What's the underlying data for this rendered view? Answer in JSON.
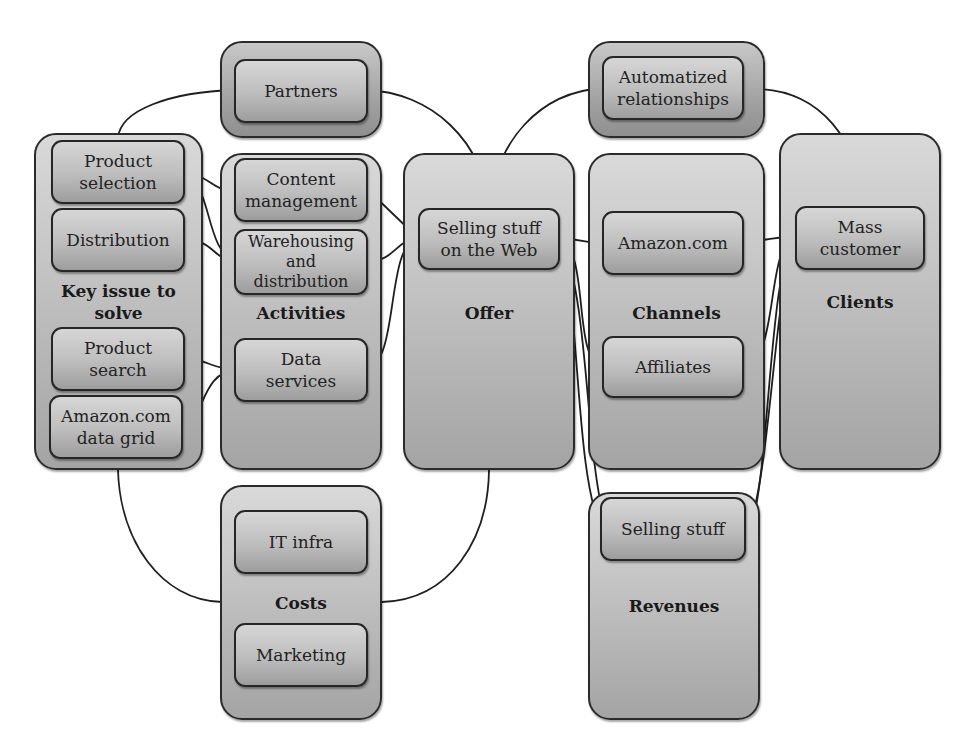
{
  "diagram": {
    "type": "business-model-canvas",
    "groups": {
      "partners": {
        "label": ""
      },
      "key_issue": {
        "label": "Key issue to\nsolve"
      },
      "activities": {
        "label": "Activities"
      },
      "offer": {
        "label": "Offer"
      },
      "relationships": {
        "label": ""
      },
      "channels": {
        "label": "Channels"
      },
      "clients": {
        "label": "Clients"
      },
      "costs": {
        "label": "Costs"
      },
      "revenues": {
        "label": "Revenues"
      }
    },
    "nodes": {
      "partners": "Partners",
      "product_selection": "Product\nselection",
      "distribution": "Distribution",
      "product_search": "Product\nsearch",
      "amazon_data_grid": "Amazon.com\ndata grid",
      "content_management": "Content\nmanagement",
      "warehousing": "Warehousing\nand\ndistribution",
      "data_services": "Data\nservices",
      "selling_web": "Selling stuff\non the Web",
      "automatized_relationships": "Automatized\nrelationships",
      "amazon_com": "Amazon.com",
      "affiliates": "Affiliates",
      "mass_customer": "Mass\ncustomer",
      "it_infra": "IT infra",
      "marketing": "Marketing",
      "selling_stuff": "Selling stuff"
    },
    "connections": [
      [
        "product_selection",
        "partners"
      ],
      [
        "partners",
        "selling_web"
      ],
      [
        "product_selection",
        "content_management"
      ],
      [
        "product_selection",
        "warehousing"
      ],
      [
        "distribution",
        "warehousing"
      ],
      [
        "product_search",
        "data_services"
      ],
      [
        "amazon_data_grid",
        "data_services"
      ],
      [
        "content_management",
        "selling_web"
      ],
      [
        "warehousing",
        "selling_web"
      ],
      [
        "data_services",
        "selling_web"
      ],
      [
        "selling_web",
        "automatized_relationships"
      ],
      [
        "automatized_relationships",
        "mass_customer"
      ],
      [
        "selling_web",
        "amazon_com"
      ],
      [
        "selling_web",
        "affiliates"
      ],
      [
        "selling_web",
        "selling_stuff"
      ],
      [
        "amazon_com",
        "mass_customer"
      ],
      [
        "affiliates",
        "mass_customer"
      ],
      [
        "mass_customer",
        "selling_stuff"
      ],
      [
        "key_issue",
        "costs"
      ],
      [
        "costs",
        "offer"
      ]
    ]
  }
}
